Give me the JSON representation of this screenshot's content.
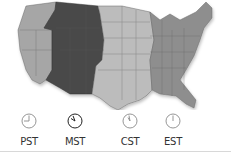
{
  "map": {
    "title": "US time zones",
    "highlighted_zone": "MST",
    "colors": {
      "pacific": "#a6a6a6",
      "mountain": "#4a4a4a",
      "central": "#bcbcbc",
      "eastern": "#8e8e8e",
      "borders": "#5a5a5a"
    }
  },
  "zones": [
    {
      "id": "pst",
      "label": "PST",
      "hour": 12,
      "minute": 45,
      "active": false
    },
    {
      "id": "mst",
      "label": "MST",
      "hour": 11,
      "minute": 50,
      "active": true
    },
    {
      "id": "cst",
      "label": "CST",
      "hour": 11,
      "minute": 55,
      "active": false
    },
    {
      "id": "est",
      "label": "EST",
      "hour": 12,
      "minute": 0,
      "active": false
    }
  ]
}
